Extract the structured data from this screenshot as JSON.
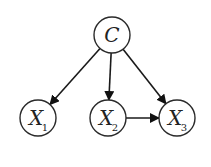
{
  "diagram": {
    "type": "bayesian-network",
    "nodes": [
      {
        "id": "C",
        "label": "C",
        "subscript": "",
        "cx": 112,
        "cy": 35,
        "r": 18
      },
      {
        "id": "X1",
        "label": "X",
        "subscript": "1",
        "cx": 38,
        "cy": 118,
        "r": 18
      },
      {
        "id": "X2",
        "label": "X",
        "subscript": "2",
        "cx": 108,
        "cy": 118,
        "r": 18
      },
      {
        "id": "X3",
        "label": "X",
        "subscript": "3",
        "cx": 177,
        "cy": 118,
        "r": 18
      }
    ],
    "edges": [
      {
        "from": "C",
        "to": "X1"
      },
      {
        "from": "C",
        "to": "X2"
      },
      {
        "from": "C",
        "to": "X3"
      },
      {
        "from": "X2",
        "to": "X3"
      }
    ],
    "colors": {
      "stroke": "#2a2a2a",
      "fill": "#ffffff",
      "arrow": "#111111"
    }
  }
}
